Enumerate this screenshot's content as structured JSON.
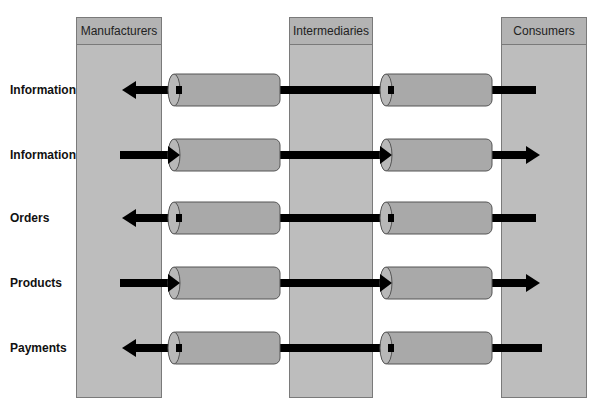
{
  "columns": [
    {
      "label": "Manufacturers",
      "x": 76,
      "width": 86
    },
    {
      "label": "Intermediaries",
      "x": 289,
      "width": 84
    },
    {
      "label": "Consumers",
      "x": 501,
      "width": 86
    }
  ],
  "rows": [
    {
      "label": "Information",
      "y": 90,
      "direction": "left"
    },
    {
      "label": "Information",
      "y": 155,
      "direction": "right"
    },
    {
      "label": "Orders",
      "y": 218,
      "direction": "left"
    },
    {
      "label": "Products",
      "y": 283,
      "direction": "right"
    },
    {
      "label": "Payments",
      "y": 348,
      "direction": "left"
    }
  ],
  "colors": {
    "column_fill": "#bdbdbd",
    "cylinder_fill": "#a9a9a9",
    "arrow": "#000000"
  }
}
